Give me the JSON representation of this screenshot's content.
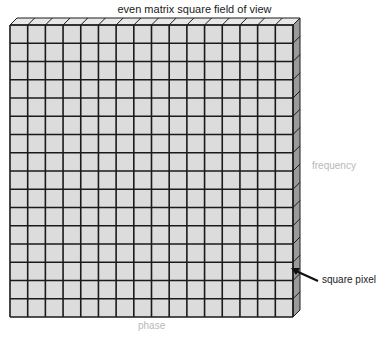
{
  "title": "even matrix square field of view",
  "labels": {
    "frequency": "frequency",
    "phase": "phase",
    "pixel": "square pixel"
  },
  "matrix": {
    "rows": 16,
    "cols": 16,
    "x": 10,
    "y": 25,
    "width": 283,
    "height": 292,
    "depth": 7,
    "face_color": "#dcdcdc",
    "top_color": "#e8e8e8",
    "side_color": "#9a9a9a",
    "line_color": "#1a1a1a"
  }
}
